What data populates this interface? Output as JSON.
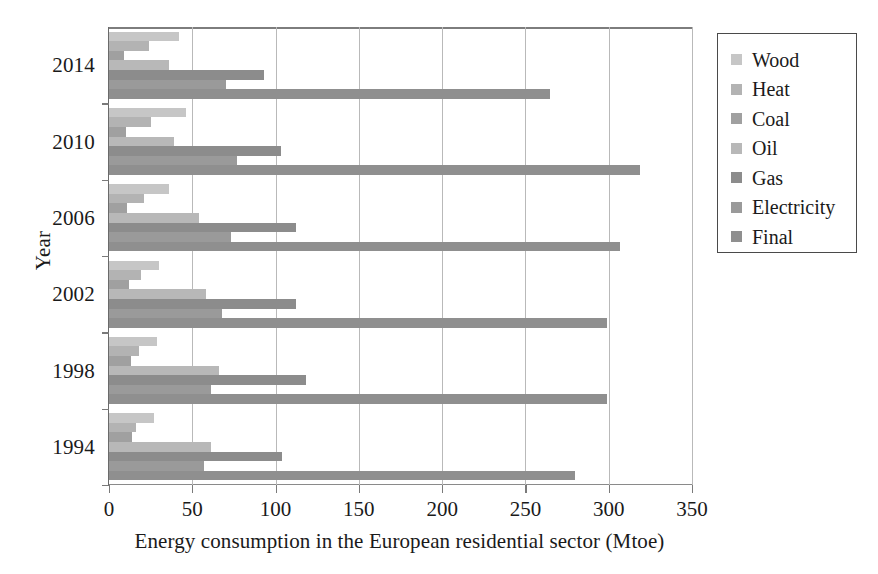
{
  "chart_data": {
    "type": "bar",
    "orientation": "horizontal",
    "title": "",
    "xlabel": "Energy consumption in the European residential sector (Mtoe)",
    "ylabel": "Year",
    "xlim": [
      0,
      350
    ],
    "xticks": [
      0,
      50,
      100,
      150,
      200,
      250,
      300,
      350
    ],
    "grid": "vertical",
    "legend_position": "right-outside",
    "categories": [
      "2014",
      "2010",
      "2006",
      "2002",
      "1998",
      "1994"
    ],
    "series": [
      {
        "name": "Wood",
        "color": "#c6c6c6",
        "values": [
          42,
          46,
          36,
          30,
          29,
          27
        ]
      },
      {
        "name": "Heat",
        "color": "#b3b3b3",
        "values": [
          24,
          25,
          21,
          19,
          18,
          16
        ]
      },
      {
        "name": "Coal",
        "color": "#a0a0a0",
        "values": [
          9,
          10,
          11,
          12,
          13,
          14
        ]
      },
      {
        "name": "Oil",
        "color": "#b8b8b8",
        "values": [
          36,
          39,
          54,
          58,
          66,
          61
        ]
      },
      {
        "name": "Gas",
        "color": "#8c8c8c",
        "values": [
          93,
          103,
          112,
          112,
          118,
          104
        ]
      },
      {
        "name": "Electricity",
        "color": "#9a9a9a",
        "values": [
          70,
          77,
          73,
          68,
          61,
          57
        ]
      },
      {
        "name": "Final",
        "color": "#8f8f8f",
        "values": [
          265,
          319,
          307,
          299,
          299,
          280
        ]
      }
    ]
  },
  "axes": {
    "y_title": "Year",
    "x_title": "Energy consumption in the European residential sector (Mtoe)",
    "x_tick_labels": [
      "0",
      "50",
      "100",
      "150",
      "200",
      "250",
      "300",
      "350"
    ],
    "y_tick_labels": [
      "2014",
      "2010",
      "2006",
      "2002",
      "1998",
      "1994"
    ]
  },
  "legend": {
    "items": [
      {
        "label": "Wood",
        "swatch_color": "#c6c6c6"
      },
      {
        "label": "Heat",
        "swatch_color": "#b3b3b3"
      },
      {
        "label": "Coal",
        "swatch_color": "#a0a0a0"
      },
      {
        "label": "Oil",
        "swatch_color": "#b8b8b8"
      },
      {
        "label": "Gas",
        "swatch_color": "#8c8c8c"
      },
      {
        "label": "Electricity",
        "swatch_color": "#9a9a9a"
      },
      {
        "label": "Final",
        "swatch_color": "#8f8f8f"
      }
    ]
  }
}
